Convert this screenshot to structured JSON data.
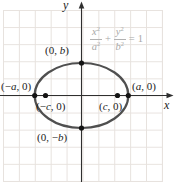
{
  "diagram": {
    "type": "ellipse-graph",
    "axes": {
      "x_label": "x",
      "y_label": "y"
    },
    "equation": {
      "num1_var": "x",
      "num1_exp": "2",
      "den1_var": "a",
      "den1_exp": "2",
      "plus": "+",
      "num2_var": "y",
      "num2_exp": "2",
      "den2_var": "b",
      "den2_exp": "2",
      "equals": "=",
      "rhs": "1"
    },
    "points": [
      {
        "id": "top-covertex",
        "pre": "(0, ",
        "var": "b",
        "post": ")"
      },
      {
        "id": "left-vertex",
        "pre": "(−",
        "var": "a",
        "post": ", 0)"
      },
      {
        "id": "left-focus",
        "pre": "(−",
        "var": "c",
        "post": ", 0)"
      },
      {
        "id": "right-focus",
        "pre": "(",
        "var": "c",
        "post": ", 0)"
      },
      {
        "id": "right-vertex",
        "pre": "(",
        "var": "a",
        "post": ", 0)"
      },
      {
        "id": "bottom-covertex",
        "pre": "(0, −",
        "var": "b",
        "post": ")"
      }
    ],
    "colors": {
      "curve": "#4f4f4f",
      "axis": "#2f2f2f",
      "grid": "#e7e2de",
      "equation_text": "#a8a8a8",
      "label_text": "#1b1b1b"
    }
  }
}
